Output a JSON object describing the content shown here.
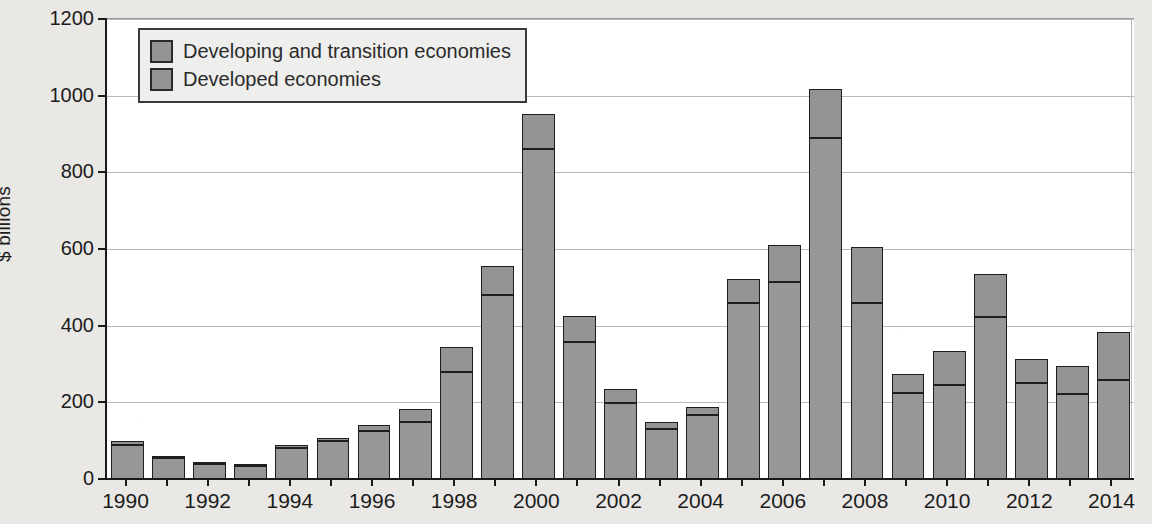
{
  "chart_data": {
    "type": "bar",
    "stacked": true,
    "title": "",
    "subtitle": "",
    "xlabel": "",
    "ylabel": "$ billions",
    "ylim": [
      0,
      1200
    ],
    "yticks": [
      0,
      200,
      400,
      600,
      800,
      1000,
      1200
    ],
    "ytick_labels": [
      "0",
      "200",
      "400",
      "600",
      "800",
      "1000",
      "1200"
    ],
    "grid": true,
    "legend_position": "top-left",
    "legend": [
      "Developing and transition economies",
      "Developed economies"
    ],
    "categories": [
      "1990",
      "1991",
      "1992",
      "1993",
      "1994",
      "1995",
      "1996",
      "1997",
      "1998",
      "1999",
      "2000",
      "2001",
      "2002",
      "2003",
      "2004",
      "2005",
      "2006",
      "2007",
      "2008",
      "2009",
      "2010",
      "2011",
      "2012",
      "2013",
      "2014"
    ],
    "xtick_labels": [
      "1990",
      "1992",
      "1994",
      "1996",
      "1998",
      "2000",
      "2002",
      "2004",
      "2006",
      "2008",
      "2010",
      "2012",
      "2014"
    ],
    "series": [
      {
        "name": "Developed economies",
        "values": [
          90,
          54,
          38,
          34,
          82,
          100,
          124,
          148,
          280,
          480,
          860,
          358,
          198,
          130,
          168,
          460,
          515,
          890,
          458,
          225,
          245,
          422,
          250,
          222,
          258
        ]
      },
      {
        "name": "Developing and transition economies",
        "values": [
          8,
          5,
          5,
          4,
          7,
          6,
          17,
          35,
          65,
          75,
          92,
          67,
          38,
          20,
          20,
          62,
          95,
          128,
          147,
          50,
          88,
          113,
          62,
          73,
          125
        ]
      }
    ],
    "totals": [
      98,
      59,
      43,
      38,
      89,
      106,
      141,
      183,
      345,
      555,
      952,
      425,
      236,
      150,
      188,
      522,
      610,
      1018,
      605,
      275,
      333,
      535,
      312,
      295,
      383
    ],
    "colors": {
      "developed": "#979797",
      "developing": "#949494",
      "bar_outline": "#1e1e1e",
      "plot_background": "#ffffff",
      "page_background": "#e9e8e5",
      "axis": "#1a1a1a",
      "gridline": "#b9b9b9",
      "legend_background": "#eeeeec",
      "text": "#1c1c1c"
    }
  }
}
